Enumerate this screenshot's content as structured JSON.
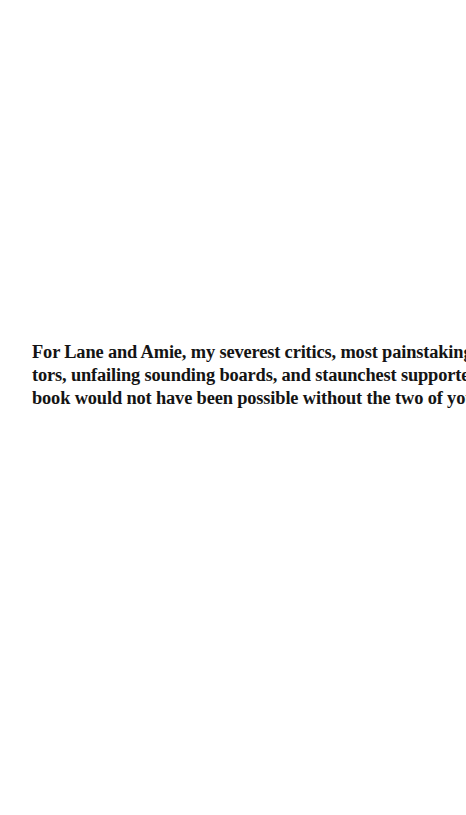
{
  "document": {
    "dedication": {
      "lines": [
        "For Lane and Amie, my severest critics, most painstaking edi-",
        "tors, unfailing sounding boards, and staunchest supporters.  This",
        "book would not have been possible without the two of you."
      ],
      "full_text": "For Lane and Amie, my severest critics, most painstaking editors, unfailing sounding boards, and staunchest supporters. This book would not have been possible without the two of you."
    }
  },
  "colors": {
    "background": "#ffffff",
    "text": "#141414"
  }
}
